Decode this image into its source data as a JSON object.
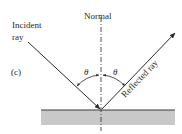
{
  "figure": {
    "panel_label": "(c)",
    "normal_label": "Normal",
    "incident_label_line1": "Incident",
    "incident_label_line2": "ray",
    "reflected_label": "Reflected ray",
    "angle_incident_symbol": "θ",
    "angle_reflected_symbol": "θ"
  },
  "colors": {
    "line": "#2a2a2a",
    "surface_fill": "#c8c8c8",
    "surface_edge": "#3a3a3a",
    "background": "#ffffff"
  }
}
